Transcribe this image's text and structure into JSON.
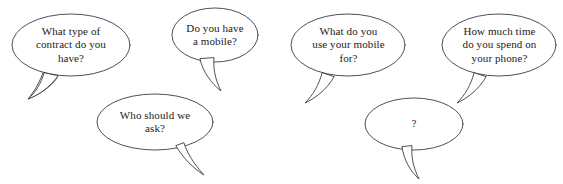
{
  "scene": {
    "title": "Speech bubble question set",
    "background_color": "#ffffff",
    "outline_color": "#3b3b46",
    "text_color": "#1a1a1a"
  },
  "bubbles": [
    {
      "id": "contract-type",
      "text": "What type of\ncontract do you\nhave?",
      "tail_direction": "down-left"
    },
    {
      "id": "have-mobile",
      "text": "Do you have\na mobile?",
      "tail_direction": "down-left"
    },
    {
      "id": "mobile-use",
      "text": "What do you\nuse your mobile\nfor?",
      "tail_direction": "down-left"
    },
    {
      "id": "phone-time",
      "text": "How much time\ndo you spend on\nyour phone?",
      "tail_direction": "down-left"
    },
    {
      "id": "who-ask",
      "text": "Who should we\nask?",
      "tail_direction": "down-right"
    },
    {
      "id": "unknown-question",
      "text": "?",
      "tail_direction": "down-left"
    }
  ]
}
